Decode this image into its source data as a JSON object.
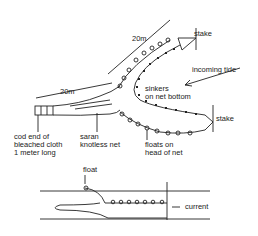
{
  "diagram": {
    "top_view": {
      "labels": {
        "stake_top": "stake",
        "stake_bottom": "stake",
        "length_upper": "20m",
        "length_lower": "20m",
        "incoming_tide": "incoming tide",
        "sinkers": "sinkers\non net bottom",
        "cod_end": "cod end of\nbleached cloth\n1 meter long",
        "saran": "saran\nknotless net",
        "floats": "floats on\nhead of net"
      }
    },
    "side_view": {
      "labels": {
        "float": "float",
        "current": "current"
      }
    },
    "colors": {
      "ink": "#222222",
      "background": "#ffffff"
    }
  }
}
